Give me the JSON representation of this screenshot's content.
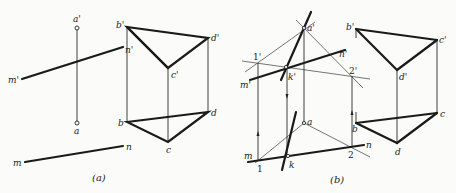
{
  "figure_a": {
    "caption": "(a)",
    "labels": {
      "a_prime": "a'",
      "a": "a",
      "m_prime": "m'",
      "n_prime": "n'",
      "m": "m",
      "n": "n",
      "b_prime": "b'",
      "c_prime": "c'",
      "d_prime": "d'",
      "b": "b",
      "c": "c",
      "d": "d"
    }
  },
  "figure_b": {
    "caption": "(b)",
    "labels": {
      "a_prime": "a'",
      "a": "a",
      "k_prime": "k'",
      "k": "k",
      "one_prime": "1'",
      "two_prime": "2'",
      "one": "1",
      "two": "2",
      "m_prime": "m'",
      "n_prime": "n'",
      "m": "m",
      "n": "n",
      "b_prime": "b'",
      "c_prime": "c'",
      "d_prime": "d'",
      "b": "b",
      "c": "c",
      "d": "d"
    }
  }
}
